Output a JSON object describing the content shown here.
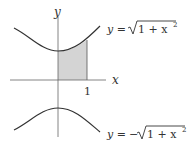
{
  "diagram": {
    "type": "function-graph",
    "axes": {
      "x_label": "x",
      "y_label": "y",
      "x_tick_label": "1"
    },
    "curves": [
      {
        "name": "upper",
        "label_lhs": "y = ",
        "label_sign": "",
        "label_radicand": "1 + x",
        "label_exp": "2",
        "equation": "y = √(1 + x^2)"
      },
      {
        "name": "lower",
        "label_lhs": "y = ",
        "label_sign": "−",
        "label_radicand": "1 + x",
        "label_exp": "2",
        "equation": "y = −√(1 + x^2)"
      }
    ],
    "shaded_region": {
      "x_from": 0,
      "x_to": 1,
      "under": "upper",
      "fill": "#d4d4d4"
    },
    "colors": {
      "curve": "#333333",
      "axis": "#555555",
      "shade": "#d4d4d4"
    }
  }
}
